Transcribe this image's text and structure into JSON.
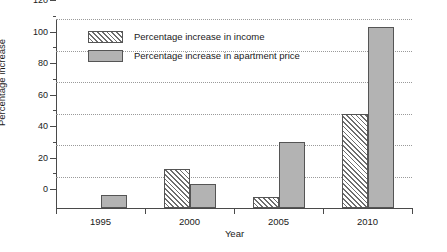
{
  "chart_data": {
    "type": "bar",
    "title": "",
    "xlabel": "Year",
    "ylabel": "Percentage increase",
    "categories": [
      "1995",
      "2000",
      "2005",
      "2010"
    ],
    "series": [
      {
        "name": "Percentage increase in income",
        "pattern": "diagonal-hatch",
        "color": "#ffffff",
        "values": [
          0,
          25,
          7,
          60
        ]
      },
      {
        "name": "Percentage increase in apartment price",
        "pattern": "solid",
        "color": "#b3b3b3",
        "values": [
          8,
          15,
          42,
          115
        ]
      }
    ],
    "ylim": [
      0,
      120
    ],
    "ytick_labels": [
      "0",
      "20",
      "40",
      "60",
      "80",
      "100",
      "120"
    ],
    "ytick_values": [
      0,
      20,
      40,
      60,
      80,
      100,
      120
    ],
    "yminor_values": [
      10,
      30,
      50,
      70,
      90,
      110
    ],
    "grid": true,
    "grid_axis": "y",
    "grid_style": "dotted",
    "legend_position": "upper-left-inside"
  },
  "legend": {
    "items": [
      {
        "label": "Percentage increase in income"
      },
      {
        "label": "Percentage increase in apartment price"
      }
    ]
  },
  "axes": {
    "y": {
      "label": "Percentage increase",
      "ticks": [
        "0",
        "20",
        "40",
        "60",
        "80",
        "100",
        "120"
      ]
    },
    "x": {
      "label": "Year",
      "ticks": [
        "1995",
        "2000",
        "2005",
        "2010"
      ]
    }
  }
}
